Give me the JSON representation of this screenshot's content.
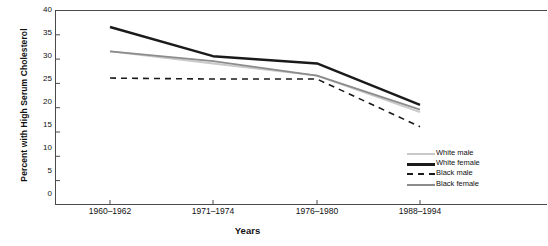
{
  "chart_data": {
    "type": "line",
    "title": "",
    "xlabel": "Years",
    "ylabel": "Percent with High Serum Cholesterol",
    "categories": [
      "1960–1962",
      "1971–1974",
      "1976–1980",
      "1988–1994"
    ],
    "ylim": [
      0,
      40
    ],
    "yticks": [
      "0",
      "5",
      "10",
      "15",
      "20",
      "25",
      "30",
      "35",
      "40"
    ],
    "grid": false,
    "legend_position": "bottom-right",
    "series": [
      {
        "name": "White male",
        "color": "#c9c9c9",
        "style": "solid",
        "values": [
          31.5,
          29.0,
          26.5,
          19.0
        ]
      },
      {
        "name": "White female",
        "color": "#1a1a1a",
        "style": "solid-thick",
        "values": [
          36.5,
          30.5,
          29.0,
          20.5
        ]
      },
      {
        "name": "Black male",
        "color": "#1a1a1a",
        "style": "dashed",
        "values": [
          26.0,
          25.8,
          25.8,
          16.0
        ]
      },
      {
        "name": "Black female",
        "color": "#8c8c8c",
        "style": "solid",
        "values": [
          31.5,
          29.5,
          26.5,
          19.5
        ]
      }
    ]
  },
  "axes": {
    "y_label": "Percent with High Serum Cholesterol",
    "x_label": "Years",
    "y_ticks": [
      "40",
      "35",
      "30",
      "25",
      "20",
      "15",
      "10",
      "5",
      "0"
    ],
    "x_ticks": [
      "1960–1962",
      "1971–1974",
      "1976–1980",
      "1988–1994"
    ]
  },
  "legend": {
    "items": [
      {
        "label": "White male"
      },
      {
        "label": "White female"
      },
      {
        "label": "Black male"
      },
      {
        "label": "Black female"
      }
    ]
  }
}
